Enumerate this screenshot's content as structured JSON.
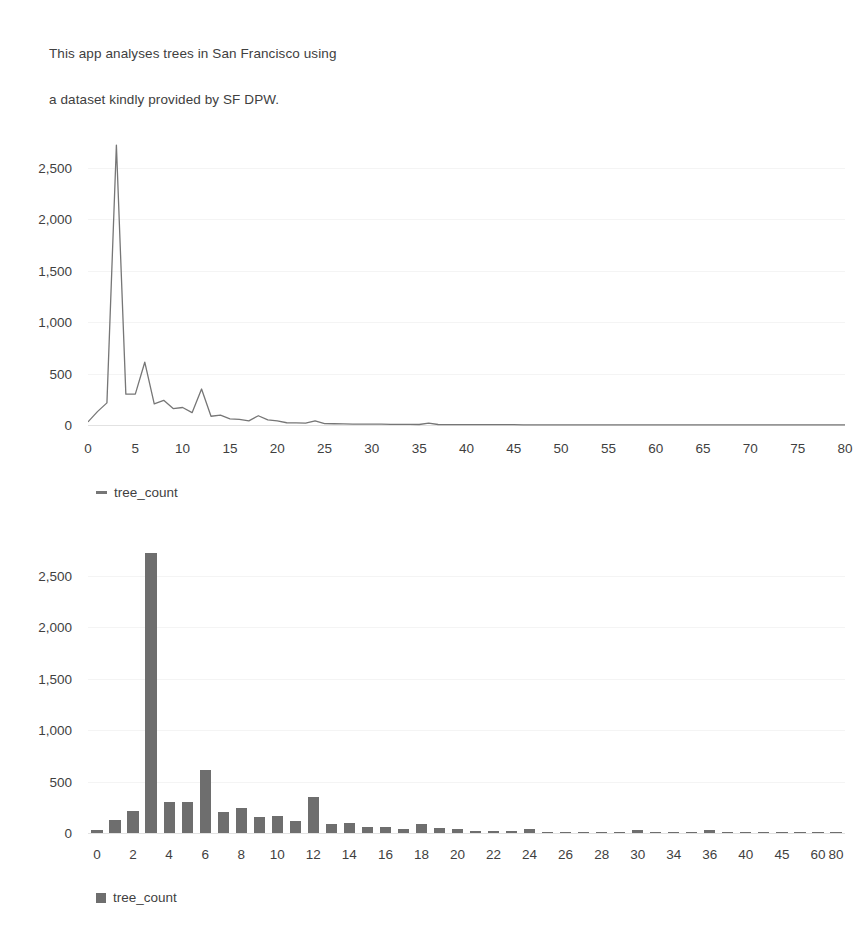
{
  "intro": {
    "line1": "This app analyses trees in San Francisco using",
    "line2": "a dataset kindly provided by SF DPW."
  },
  "colors": {
    "line_series": "#767676",
    "bar_series": "#6e6e6e",
    "text": "#3f3f3f",
    "gridline": "#f4f4f4",
    "background": "#ffffff"
  },
  "chart_data": [
    {
      "type": "line",
      "title": "",
      "xlabel": "",
      "ylabel": "",
      "series_name": "tree_count",
      "legend": [
        "tree_count"
      ],
      "legend_position": "bottom-left",
      "grid": true,
      "ylim": [
        0,
        2750
      ],
      "yticks": [
        0,
        500,
        1000,
        1500,
        2000,
        2500
      ],
      "ytick_labels": [
        "0",
        "500",
        "1,000",
        "1,500",
        "2,000",
        "2,500"
      ],
      "xlim": [
        0,
        80
      ],
      "xticks": [
        0,
        5,
        10,
        15,
        20,
        25,
        30,
        35,
        40,
        45,
        50,
        55,
        60,
        65,
        70,
        75,
        80
      ],
      "xtick_labels": [
        "0",
        "5",
        "10",
        "15",
        "20",
        "25",
        "30",
        "35",
        "40",
        "45",
        "50",
        "55",
        "60",
        "65",
        "70",
        "75",
        "80"
      ],
      "x": [
        0,
        1,
        2,
        3,
        4,
        5,
        6,
        7,
        8,
        9,
        10,
        11,
        12,
        13,
        14,
        15,
        16,
        17,
        18,
        19,
        20,
        21,
        22,
        23,
        24,
        25,
        26,
        27,
        28,
        29,
        30,
        31,
        32,
        33,
        34,
        35,
        36,
        37,
        38,
        39,
        40,
        41,
        42,
        43,
        44,
        45,
        46,
        47,
        48,
        49,
        50,
        51,
        52,
        53,
        54,
        55,
        56,
        57,
        58,
        59,
        60,
        61,
        62,
        63,
        64,
        65,
        66,
        67,
        68,
        69,
        70,
        71,
        72,
        73,
        74,
        75,
        76,
        77,
        78,
        79,
        80
      ],
      "values": [
        30,
        130,
        215,
        2720,
        300,
        300,
        610,
        205,
        240,
        160,
        170,
        120,
        350,
        85,
        95,
        60,
        55,
        40,
        90,
        50,
        40,
        22,
        20,
        18,
        40,
        14,
        12,
        10,
        9,
        8,
        9,
        8,
        7,
        6,
        6,
        5,
        18,
        5,
        4,
        4,
        3,
        3,
        3,
        3,
        3,
        3,
        2,
        2,
        2,
        2,
        2,
        2,
        2,
        2,
        2,
        2,
        2,
        2,
        2,
        2,
        2,
        1,
        1,
        1,
        1,
        1,
        1,
        1,
        1,
        1,
        1,
        1,
        1,
        1,
        1,
        1,
        1,
        1,
        1,
        1,
        1
      ]
    },
    {
      "type": "bar",
      "title": "",
      "xlabel": "",
      "ylabel": "",
      "series_name": "tree_count",
      "legend": [
        "tree_count"
      ],
      "legend_position": "bottom-left",
      "grid": true,
      "ylim": [
        0,
        2750
      ],
      "yticks": [
        0,
        500,
        1000,
        1500,
        2000,
        2500
      ],
      "ytick_labels": [
        "0",
        "500",
        "1,000",
        "1,500",
        "2,000",
        "2,500"
      ],
      "categories": [
        "0",
        "1",
        "2",
        "3",
        "4",
        "5",
        "6",
        "7",
        "8",
        "9",
        "10",
        "11",
        "12",
        "13",
        "14",
        "15",
        "16",
        "17",
        "18",
        "19",
        "20",
        "21",
        "22",
        "23",
        "24",
        "25",
        "26",
        "27",
        "28",
        "29",
        "30",
        "32",
        "34",
        "35",
        "36",
        "38",
        "40",
        "42",
        "45",
        "50",
        "60",
        "80"
      ],
      "visible_xtick_labels": [
        "0",
        "2",
        "4",
        "6",
        "8",
        "10",
        "12",
        "14",
        "16",
        "18",
        "20",
        "22",
        "24",
        "26",
        "28",
        "30",
        "34",
        "36",
        "40",
        "45",
        "60",
        "80"
      ],
      "values": [
        30,
        130,
        215,
        2720,
        300,
        300,
        610,
        205,
        240,
        160,
        170,
        120,
        350,
        85,
        95,
        60,
        55,
        40,
        90,
        50,
        40,
        22,
        20,
        18,
        40,
        14,
        12,
        10,
        9,
        8,
        30,
        6,
        6,
        5,
        28,
        4,
        3,
        3,
        3,
        2,
        2,
        1
      ]
    }
  ]
}
